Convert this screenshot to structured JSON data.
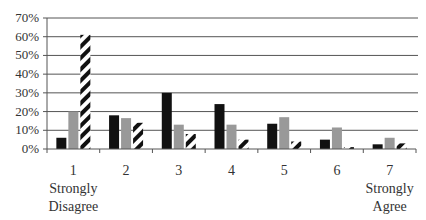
{
  "chart_data": {
    "type": "bar",
    "title": "",
    "xlabel": "",
    "ylabel": "",
    "categories": [
      "1",
      "2",
      "3",
      "4",
      "5",
      "6",
      "7"
    ],
    "category_sublabels": {
      "1": [
        "Strongly",
        "Disagree"
      ],
      "7": [
        "Strongly",
        "Agree"
      ]
    },
    "series": [
      {
        "name": "Series 1 (black)",
        "color": "#111111",
        "pattern": "solid",
        "values": [
          0.06,
          0.18,
          0.3,
          0.24,
          0.135,
          0.05,
          0.025
        ]
      },
      {
        "name": "Series 2 (gray)",
        "color": "#999999",
        "pattern": "solid",
        "values": [
          0.2,
          0.165,
          0.13,
          0.13,
          0.17,
          0.115,
          0.06
        ]
      },
      {
        "name": "Series 3 (hatched)",
        "color": "#111111",
        "pattern": "diagonal-hatch",
        "values": [
          0.61,
          0.14,
          0.08,
          0.05,
          0.04,
          0.01,
          0.03
        ]
      }
    ],
    "yticks": [
      "0%",
      "10%",
      "20%",
      "30%",
      "40%",
      "50%",
      "60%",
      "70%"
    ],
    "ylim": [
      0,
      0.7
    ],
    "grid": true,
    "legend": "none visible"
  }
}
